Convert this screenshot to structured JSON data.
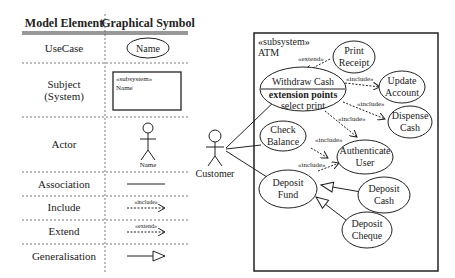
{
  "legend": {
    "headers": {
      "element": "Model Element",
      "symbol": "Graphical Symbol"
    },
    "rows": [
      {
        "element": "UseCase",
        "symbol_text": "Name"
      },
      {
        "element": "Subject",
        "element2": "(System)",
        "symbol_stereotype": "«subsystem»",
        "symbol_text": "Name"
      },
      {
        "element": "Actor",
        "symbol_text": "Name"
      },
      {
        "element": "Association"
      },
      {
        "element": "Include",
        "symbol_text": "«include»"
      },
      {
        "element": "Extend",
        "symbol_text": "«extend»"
      },
      {
        "element": "Generalisation"
      }
    ]
  },
  "diagram": {
    "subsystem_stereotype": "«subsystem»",
    "subsystem_name": "ATM",
    "actor": "Customer",
    "usecases": {
      "print_receipt": [
        "Print",
        "Receipt"
      ],
      "withdraw_cash": "Withdraw Cash",
      "extension_points": "extension points",
      "select_print": "select print",
      "update_account": [
        "Update",
        "Account"
      ],
      "dispense_cash": [
        "Dispense",
        "Cash"
      ],
      "check_balance": [
        "Check",
        "Balance"
      ],
      "authenticate_user": [
        "Authenticate",
        "User"
      ],
      "deposit_fund": [
        "Deposit",
        "Fund"
      ],
      "deposit_cash": [
        "Deposit",
        "Cash"
      ],
      "deposit_cheque": [
        "Deposit",
        "Cheque"
      ]
    },
    "labels": {
      "extend": "«extend»",
      "include": "«include»"
    }
  }
}
